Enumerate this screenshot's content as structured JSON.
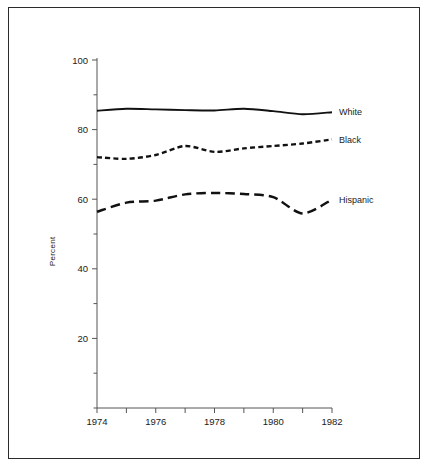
{
  "chart_data": {
    "type": "line",
    "title": "",
    "xlabel": "",
    "ylabel": "Percent",
    "xlim": [
      1974,
      1982
    ],
    "ylim": [
      0,
      100
    ],
    "grid": false,
    "legend_position": "inline-right",
    "x": [
      1974,
      1975,
      1976,
      1977,
      1978,
      1979,
      1980,
      1981,
      1982
    ],
    "x_tick_values": [
      1974,
      1975,
      1976,
      1977,
      1978,
      1979,
      1980,
      1981,
      1982
    ],
    "x_tick_labels": [
      "1974",
      "",
      "1976",
      "",
      "1978",
      "",
      "1980",
      "",
      "1982"
    ],
    "y_tick_values": [
      0,
      10,
      20,
      30,
      40,
      50,
      60,
      70,
      80,
      90,
      100
    ],
    "y_tick_labels": [
      "",
      "",
      "20",
      "",
      "40",
      "",
      "60",
      "",
      "80",
      "",
      "100"
    ],
    "series": [
      {
        "name": "White",
        "label": "White",
        "style": "solid",
        "color": "#111111",
        "values": [
          85.4,
          86.0,
          85.8,
          85.6,
          85.5,
          86.0,
          85.3,
          84.4,
          85.0
        ]
      },
      {
        "name": "Black",
        "label": "Black",
        "style": "short-dash",
        "color": "#111111",
        "values": [
          72.1,
          71.6,
          72.7,
          75.3,
          73.6,
          74.6,
          75.3,
          76.0,
          77.2
        ]
      },
      {
        "name": "Hispanic",
        "label": "Hispanic",
        "style": "long-dash",
        "color": "#111111",
        "values": [
          56.4,
          59.0,
          59.6,
          61.4,
          61.8,
          61.5,
          60.6,
          55.9,
          59.9
        ]
      }
    ]
  },
  "axis": {
    "y_title": "Percent"
  }
}
